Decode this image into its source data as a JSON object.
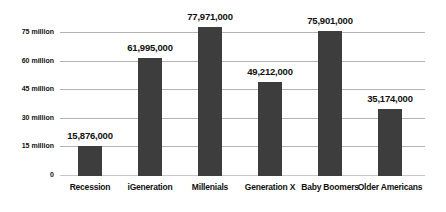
{
  "chart_data": {
    "type": "bar",
    "title": "",
    "subtitle": "",
    "xlabel": "",
    "ylabel": "",
    "categories": [
      "Recession",
      "iGeneration",
      "Millenials",
      "Generation X",
      "Baby Boomers",
      "Older Americans"
    ],
    "values": [
      15876000,
      61995000,
      77971000,
      49212000,
      75901000,
      35174000
    ],
    "value_labels": [
      "15,876,000",
      "61,995,000",
      "77,971,000",
      "49,212,000",
      "75,901,000",
      "35,174,000"
    ],
    "ylim": [
      0,
      80000000
    ],
    "yticks": [
      0,
      15000000,
      30000000,
      45000000,
      60000000,
      75000000
    ],
    "ytick_labels": [
      "0",
      "15 million",
      "30 million",
      "45 million",
      "60 million",
      "75 million"
    ],
    "grid": true,
    "legend": false,
    "legend_position": "none",
    "colors": {
      "bar_fill": "#3d3d3d",
      "gridline": "#b4b4b4",
      "baseline": "#c8c8c8",
      "text": "#111111",
      "background": "#ffffff"
    }
  }
}
